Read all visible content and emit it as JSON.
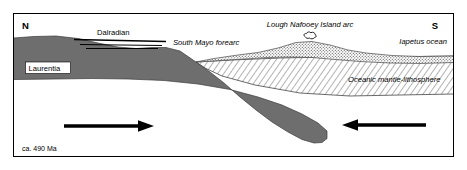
{
  "figure": {
    "age_caption": "ca. 490 Ma",
    "orientation": {
      "left": "N",
      "right": "S"
    },
    "colors": {
      "frame": "#000000",
      "background": "#ffffff",
      "laurentia_fill": "#6e6e6e",
      "oceanic_crust_stipple": "#8a8a8a",
      "mantle_hatch": "#555555",
      "arrow": "#000000",
      "text": "#000000"
    },
    "units": [
      {
        "id": "laurentia",
        "label": "Laurentia",
        "style": "solid-gray",
        "label_style": "boxed"
      },
      {
        "id": "dalradian",
        "label": "Dalradian",
        "style": "thrust-lines",
        "label_style": "plain"
      },
      {
        "id": "south-mayo-forearc",
        "label": "South Mayo forearc",
        "style": "none",
        "label_style": "italic"
      },
      {
        "id": "lough-nafooey-island-arc",
        "label": "Lough Nafooey Island arc",
        "style": "stipple",
        "label_style": "italic"
      },
      {
        "id": "iapetus-ocean",
        "label": "Iapetus ocean",
        "style": "none",
        "label_style": "italic"
      },
      {
        "id": "oceanic-mantle-lithosphere",
        "label": "Oceanic mantle-lithosphere",
        "style": "diagonal-hatch",
        "label_style": "italic"
      }
    ],
    "motion_arrows": [
      {
        "id": "laurentia-convergence",
        "direction": "right",
        "label": ""
      },
      {
        "id": "iapetus-convergence",
        "direction": "left",
        "label": ""
      }
    ]
  }
}
